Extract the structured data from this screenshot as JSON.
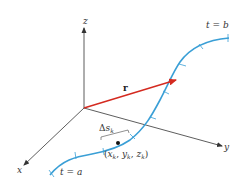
{
  "diagram": {
    "type": "3d-space-curve-arc-length",
    "colors": {
      "axes": "#333333",
      "curve": "#3a9fd6",
      "vector": "#d42a20",
      "point": "#111111",
      "background": "#ffffff"
    },
    "axes": {
      "x": {
        "label": "x"
      },
      "y": {
        "label": "y"
      },
      "z": {
        "label": "z"
      }
    },
    "vector": {
      "label": "r"
    },
    "curve": {
      "start_label": "t = a",
      "end_label": "t = b"
    },
    "segment": {
      "delta": "Δ",
      "s": "s",
      "sub": "k"
    },
    "point": {
      "open": "(",
      "x": "x",
      "y": "y",
      "z": "z",
      "sub": "k",
      "comma": ", ",
      "close": ")"
    }
  }
}
